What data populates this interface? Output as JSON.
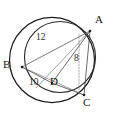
{
  "figure": {
    "background_color": "#ffffff",
    "stroke_color": "#1c1c1c",
    "faint_stroke_color": "#8a8a8a",
    "vertices": [
      {
        "id": "A",
        "label": "A",
        "x": 90,
        "y": 31,
        "label_x": 94,
        "label_y": 18
      },
      {
        "id": "B",
        "label": "B",
        "x": 22,
        "y": 67,
        "label_x": 5,
        "label_y": 60
      },
      {
        "id": "C",
        "label": "C",
        "x": 84,
        "y": 97,
        "label_x": 85,
        "label_y": 97
      },
      {
        "id": "D",
        "label": "D",
        "x": 52,
        "y": 83,
        "label_x": 51,
        "label_y": 79
      }
    ],
    "measures": [
      {
        "id": "m12",
        "label": "12",
        "segment": "B-A",
        "x": 39,
        "y": 37
      },
      {
        "id": "m8",
        "label": "8",
        "segment": "A-foot",
        "x": 76,
        "y": 58
      },
      {
        "id": "m10",
        "label": "10",
        "segment": "B-D",
        "x": 32,
        "y": 80
      }
    ],
    "circles": [
      {
        "id": "outer-circle",
        "cx": 52,
        "cy": 60,
        "r": 43
      },
      {
        "id": "inner-circle",
        "cx": 60,
        "cy": 57,
        "r": 36
      }
    ],
    "segments": [
      {
        "id": "seg-BA",
        "from": "B",
        "to": "A",
        "style": "dashed"
      },
      {
        "id": "seg-BD",
        "from": "B",
        "to": "D",
        "style": "solid"
      },
      {
        "id": "seg-BC",
        "from": "B",
        "to": "C",
        "style": "solid"
      },
      {
        "id": "seg-AD",
        "from": "A",
        "to": "D",
        "style": "solid"
      },
      {
        "id": "seg-AC",
        "from": "A",
        "to": "C",
        "style": "solid"
      },
      {
        "id": "seg-DC",
        "from": "D",
        "to": "C",
        "style": "solid"
      },
      {
        "id": "seg-A-foot",
        "from": "A",
        "to": "foot",
        "style": "dashed"
      }
    ]
  }
}
